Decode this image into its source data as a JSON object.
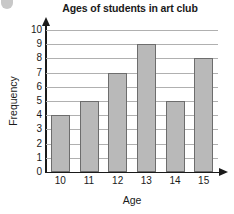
{
  "chart_data": {
    "type": "bar",
    "title": "Ages of students in art club",
    "xlabel": "Age",
    "ylabel": "Frequency",
    "categories": [
      "10",
      "11",
      "12",
      "13",
      "14",
      "15"
    ],
    "values": [
      4,
      5,
      7,
      9,
      5,
      8
    ],
    "ylim": [
      0,
      10
    ],
    "y_ticks": [
      "10",
      "9",
      "8",
      "7",
      "6",
      "5",
      "4",
      "3",
      "2",
      "1",
      "0"
    ],
    "grid": true,
    "legend": "none",
    "bar_fill_color": "#b9b9b9",
    "bar_border_color": "#6d6d6d",
    "gridline_color": "#b0b0b0",
    "axis_color": "#1a1a1a",
    "background_color": "#ffffff"
  }
}
